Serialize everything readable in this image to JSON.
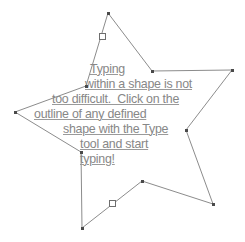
{
  "document": {
    "canvas_width": 245,
    "canvas_height": 242,
    "background_color": "#ffffff"
  },
  "shape": {
    "name": "star-path",
    "type": "star",
    "stroke_color": "#8c8c8c",
    "fill": "none",
    "stroke_width": 1,
    "points": [
      {
        "x": 108,
        "y": 13,
        "kind": "outer",
        "label": "top-point"
      },
      {
        "x": 152,
        "y": 71,
        "kind": "inner",
        "label": "upper-right-inner"
      },
      {
        "x": 232,
        "y": 70,
        "kind": "outer",
        "label": "right-point"
      },
      {
        "x": 186,
        "y": 130,
        "kind": "inner",
        "label": "lower-right-inner"
      },
      {
        "x": 213,
        "y": 204,
        "kind": "outer",
        "label": "bottom-right-point"
      },
      {
        "x": 142,
        "y": 181,
        "kind": "inner",
        "label": "bottom-inner"
      },
      {
        "x": 82,
        "y": 228,
        "kind": "outer",
        "label": "bottom-left-point"
      },
      {
        "x": 81,
        "y": 152,
        "kind": "inner",
        "label": "lower-left-inner"
      },
      {
        "x": 15,
        "y": 112,
        "kind": "outer",
        "label": "left-point"
      },
      {
        "x": 86,
        "y": 86,
        "kind": "inner",
        "label": "upper-left-inner"
      }
    ],
    "handles": [
      {
        "x": 102,
        "y": 36,
        "label": "upper-left-segment-handle"
      },
      {
        "x": 112,
        "y": 203,
        "label": "lower-segment-handle"
      }
    ]
  },
  "text_frame": {
    "name": "shape-text",
    "color": "#878787",
    "underline": true,
    "full_text": "Typing within a shape is not too difficult.  Click on the outline of any defined shape with the Type tool and start typing!",
    "lines": [
      {
        "text": "Typing",
        "x": 90,
        "y": 63
      },
      {
        "text": "within a shape is not",
        "x": 85,
        "y": 78
      },
      {
        "text": "too difficult.  Click on the",
        "x": 52,
        "y": 93
      },
      {
        "text": "outline of any defined",
        "x": 34,
        "y": 108
      },
      {
        "text": "shape with the Type",
        "x": 63,
        "y": 123
      },
      {
        "text": "tool and start",
        "x": 80,
        "y": 138
      },
      {
        "text": "typing!",
        "x": 80,
        "y": 153
      }
    ]
  }
}
